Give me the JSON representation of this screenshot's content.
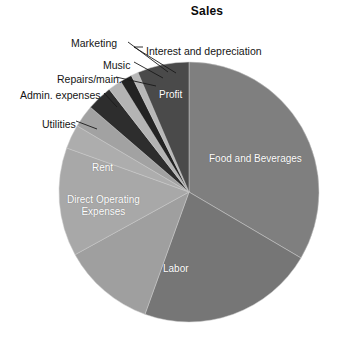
{
  "chart_data": {
    "type": "pie",
    "title": "Sales",
    "xlabel": "",
    "ylabel": "",
    "legend": "none",
    "grid": false,
    "labels": [
      "Food and Beverages",
      "Labor",
      "Direct Operating Expenses",
      "Rent",
      "Utilities",
      "Admin. expenses",
      "Repairs/main.",
      "Music",
      "Marketing",
      "Interest and depreciation",
      "Profit"
    ],
    "values": [
      33.5,
      22.0,
      11.5,
      13.5,
      3.0,
      2.8,
      3.2,
      1.7,
      1.5,
      0.9,
      6.4
    ],
    "units": "percent of sales",
    "slices": [
      {
        "label": "Food and Beverages",
        "value": 33.5,
        "start_deg": 0.0,
        "end_deg": 120.5,
        "color": "#7f7f7f",
        "label_placement": "inside"
      },
      {
        "label": "Labor",
        "value": 22.0,
        "start_deg": 120.5,
        "end_deg": 199.8,
        "color": "#767676",
        "label_placement": "inside"
      },
      {
        "label": "Direct Operating Expenses",
        "value": 11.5,
        "start_deg": 199.8,
        "end_deg": 241.2,
        "color": "#9f9f9f",
        "label_placement": "inside"
      },
      {
        "label": "Rent",
        "value": 13.5,
        "start_deg": 241.2,
        "end_deg": 289.8,
        "color": "#a8a8a8",
        "label_placement": "inside"
      },
      {
        "label": "Utilities",
        "value": 3.0,
        "start_deg": 289.8,
        "end_deg": 300.6,
        "color": "#adadad",
        "label_placement": "callout"
      },
      {
        "label": "Admin. expenses",
        "value": 2.8,
        "start_deg": 300.6,
        "end_deg": 310.7,
        "color": "#a2a2a2",
        "label_placement": "callout"
      },
      {
        "label": "Repairs/main.",
        "value": 3.2,
        "start_deg": 310.7,
        "end_deg": 322.2,
        "color": "#2d2d2d",
        "label_placement": "callout"
      },
      {
        "label": "Music",
        "value": 1.7,
        "start_deg": 322.2,
        "end_deg": 328.3,
        "color": "#b4b4b4",
        "label_placement": "callout"
      },
      {
        "label": "Marketing",
        "value": 1.5,
        "start_deg": 328.3,
        "end_deg": 333.7,
        "color": "#232323",
        "label_placement": "callout"
      },
      {
        "label": "Interest and depreciation",
        "value": 0.9,
        "start_deg": 333.7,
        "end_deg": 336.9,
        "color": "#b8b8b8",
        "label_placement": "callout"
      },
      {
        "label": "Profit",
        "value": 6.4,
        "start_deg": 336.9,
        "end_deg": 360.0,
        "color": "#4a4a4a",
        "label_placement": "inside"
      }
    ],
    "geometry": {
      "center_x": 189,
      "center_y": 192,
      "radius": 130
    }
  },
  "inside_labels": [
    {
      "text": "Food and Beverages",
      "x": 209,
      "y": 153
    },
    {
      "text": "Labor",
      "x": 163,
      "y": 263
    },
    {
      "text": "Rent",
      "x": 92,
      "y": 162
    },
    {
      "text": "Profit",
      "x": 159,
      "y": 89
    }
  ],
  "inside_labels_multiline": [
    {
      "line1": "Direct Operating",
      "line2": "Expenses",
      "x": 67,
      "y": 194
    }
  ],
  "callout_labels": [
    {
      "text": "Marketing",
      "x": 71,
      "y": 37
    },
    {
      "text": "Interest and depreciation",
      "x": 146,
      "y": 45
    },
    {
      "text": "Music",
      "x": 103,
      "y": 59
    },
    {
      "text": "Repairs/main.",
      "x": 57,
      "y": 73
    },
    {
      "text": "Admin. expenses",
      "x": 20,
      "y": 89
    },
    {
      "text": "Utilities",
      "x": 42,
      "y": 118
    }
  ],
  "leader_lines": [
    {
      "name": "marketing",
      "points": "128,42 168,72"
    },
    {
      "name": "interest",
      "points": "143,47 134,47 134,47"
    },
    {
      "name": "interest2",
      "points": "134,47 176,73"
    },
    {
      "name": "music",
      "points": "134,62 163,78"
    },
    {
      "name": "repairs",
      "points": "116,77 156,86"
    },
    {
      "name": "admin",
      "points": "104,93 117,107"
    },
    {
      "name": "utilities",
      "points": "76,121 97,129"
    }
  ]
}
